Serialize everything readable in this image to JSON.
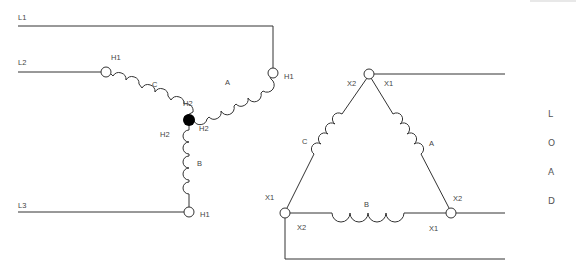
{
  "diagram": {
    "type": "wye-delta transformer connection",
    "lines": [
      {
        "id": "L1",
        "label": "L1"
      },
      {
        "id": "L2",
        "label": "L2"
      },
      {
        "id": "L3",
        "label": "L3"
      }
    ],
    "primary": {
      "connection": "wye",
      "windings": [
        {
          "name": "A",
          "label": "A",
          "start": "H1",
          "end": "H2"
        },
        {
          "name": "B",
          "label": "B",
          "start": "H2",
          "end": "H1"
        },
        {
          "name": "C",
          "label": "C",
          "start": "H1",
          "end": "H2"
        }
      ],
      "terminal_labels": {
        "c_h1": "H1",
        "a_h1": "H1",
        "b_h1": "H1",
        "c_h2": "H2",
        "a_h2": "H2",
        "b_h2": "H2"
      }
    },
    "secondary": {
      "connection": "delta",
      "windings": [
        {
          "name": "A",
          "label": "A"
        },
        {
          "name": "B",
          "label": "B"
        },
        {
          "name": "C",
          "label": "C"
        }
      ],
      "terminal_labels": {
        "top_left": "X2",
        "top_right": "X1",
        "left_upper": "X1",
        "left_lower": "X2",
        "right_upper": "X2",
        "right_lower": "X1"
      }
    },
    "load_label": [
      "L",
      "O",
      "A",
      "D"
    ]
  }
}
